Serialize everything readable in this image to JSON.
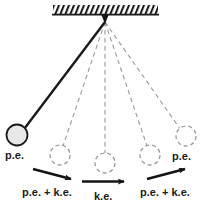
{
  "figure": {
    "background_color": "#ffffff",
    "ink_color": "#1b1b1b",
    "ghost_color": "#9a9a9a",
    "bob_fill_color": "#e8e8e8"
  },
  "support": {
    "name": "ceiling-hatched-bar",
    "x": 53,
    "y": 5,
    "width": 105,
    "height": 9,
    "hatch_direction": "forward-slash"
  },
  "pivot": {
    "name": "pivot-point",
    "x": 105,
    "y": 21
  },
  "bobs": [
    {
      "id": "bob-1",
      "label": "p.e.",
      "style": "solid",
      "cx": 17,
      "cy": 135,
      "r": 10.5,
      "filled": true
    },
    {
      "id": "bob-2",
      "label": "",
      "style": "dashed",
      "cx": 60,
      "cy": 155,
      "r": 10,
      "filled": false
    },
    {
      "id": "bob-3",
      "label": "",
      "style": "dashed",
      "cx": 105,
      "cy": 163,
      "r": 10,
      "filled": false
    },
    {
      "id": "bob-4",
      "label": "",
      "style": "dashed",
      "cx": 150,
      "cy": 155,
      "r": 10,
      "filled": false
    },
    {
      "id": "bob-5",
      "label": "p.e.",
      "style": "dashed",
      "cx": 186,
      "cy": 136,
      "r": 10,
      "filled": false
    }
  ],
  "labels": {
    "pe_left": {
      "text": "p.e.",
      "x": 5,
      "y": 150
    },
    "pe_right": {
      "text": "p.e.",
      "x": 172,
      "y": 151
    },
    "pe_ke_left": {
      "text": "p.e. + k.e.",
      "x": 22,
      "y": 187
    },
    "ke_center": {
      "text": "k.e.",
      "x": 94,
      "y": 192
    },
    "pe_ke_right": {
      "text": "p.e. + k.e.",
      "x": 140,
      "y": 187
    }
  },
  "arrows": [
    {
      "id": "arrow-left",
      "name": "velocity-arrow-left",
      "x1": 33,
      "y1": 170,
      "x2": 73,
      "y2": 180,
      "direction": "down-right"
    },
    {
      "id": "arrow-center",
      "name": "velocity-arrow-center",
      "x1": 82,
      "y1": 182,
      "x2": 126,
      "y2": 182,
      "direction": "right"
    },
    {
      "id": "arrow-right",
      "name": "velocity-arrow-right",
      "x1": 146,
      "y1": 180,
      "x2": 186,
      "y2": 170,
      "direction": "up-right"
    }
  ],
  "rods": [
    {
      "id": "rod-1",
      "style": "solid",
      "from": [
        105,
        21
      ],
      "to": [
        24,
        128
      ]
    },
    {
      "id": "rod-2",
      "style": "dashed",
      "from": [
        105,
        21
      ],
      "to": [
        63,
        145
      ]
    },
    {
      "id": "rod-3",
      "style": "dashed",
      "from": [
        105,
        21
      ],
      "to": [
        105,
        153
      ]
    },
    {
      "id": "rod-4",
      "style": "dashed",
      "from": [
        105,
        21
      ],
      "to": [
        147,
        145
      ]
    },
    {
      "id": "rod-5",
      "style": "dashed",
      "from": [
        105,
        21
      ],
      "to": [
        179,
        128
      ]
    }
  ]
}
